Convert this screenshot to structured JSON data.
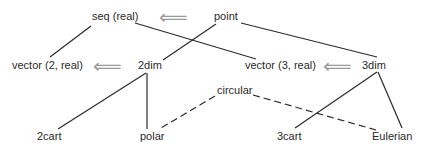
{
  "diagram": {
    "type": "type-hierarchy",
    "colors": {
      "text": "#2a2a2a",
      "line": "#2a2a2a",
      "arrow": "#9a9a9a",
      "background": "#ffffff"
    },
    "arrow_glyph": "⟸",
    "nodes": {
      "seq_real": "seq (real)",
      "point": "point",
      "vector2": "vector (2, real)",
      "dim2": "2dim",
      "vector3": "vector (3, real)",
      "dim3": "3dim",
      "circular": "circular",
      "cart2": "2cart",
      "polar": "polar",
      "cart3": "3cart",
      "eulerian": "Eulerian"
    },
    "edges": [
      {
        "from": "seq (real)",
        "to": "vector (2, real)",
        "style": "solid"
      },
      {
        "from": "seq (real)",
        "to": "vector (3, real)",
        "style": "solid"
      },
      {
        "from": "point",
        "to": "2dim",
        "style": "solid"
      },
      {
        "from": "point",
        "to": "3dim",
        "style": "solid"
      },
      {
        "from": "2dim",
        "to": "2cart",
        "style": "solid"
      },
      {
        "from": "2dim",
        "to": "polar",
        "style": "solid"
      },
      {
        "from": "3dim",
        "to": "3cart",
        "style": "solid"
      },
      {
        "from": "3dim",
        "to": "Eulerian",
        "style": "solid"
      },
      {
        "from": "circular",
        "to": "polar",
        "style": "dashed"
      },
      {
        "from": "circular",
        "to": "Eulerian",
        "style": "dashed"
      }
    ],
    "implementation_arrows": [
      {
        "from": "point",
        "to": "seq (real)"
      },
      {
        "from": "2dim",
        "to": "vector (2, real)"
      },
      {
        "from": "3dim",
        "to": "vector (3, real)"
      }
    ]
  }
}
